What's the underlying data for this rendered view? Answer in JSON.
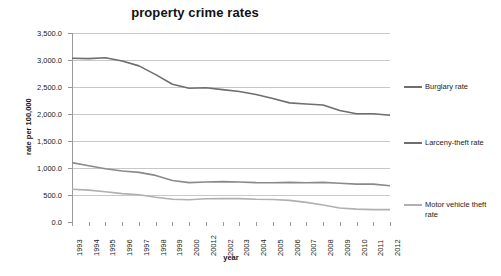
{
  "chart_data": {
    "type": "line",
    "title": "property crime rates",
    "xlabel": "year",
    "ylabel": "rate per 100,000",
    "ylim": [
      0,
      3500
    ],
    "ytick_step": 500,
    "grid": true,
    "legend_position": "right",
    "categories": [
      "1993",
      "1994",
      "1995",
      "1996",
      "1997",
      "1998",
      "1999",
      "2000",
      "20012",
      "2002",
      "2003",
      "2004",
      "2005",
      "2006",
      "2007",
      "2008",
      "2009",
      "2010",
      "2011",
      "2012"
    ],
    "ytick_labels": [
      "0.0",
      "500.0",
      "1,000.0",
      "1,500.0",
      "2,000.0",
      "2,500.0",
      "3,000.0",
      "3,500.0"
    ],
    "ytick_values": [
      0,
      500,
      1000,
      1500,
      2000,
      2500,
      3000,
      3500
    ],
    "series": [
      {
        "name": "Larceny-theft rate",
        "color": "#6e6e6e",
        "values": [
          3033,
          3026,
          3043,
          2980,
          2891,
          2729,
          2551,
          2477,
          2485,
          2451,
          2416,
          2362,
          2287,
          2206,
          2185,
          2167,
          2064,
          2005,
          2005,
          1977
        ]
      },
      {
        "name": "Burglary rate",
        "color": "#8a8a8a",
        "values": [
          1100,
          1042,
          987,
          945,
          919,
          863,
          770,
          729,
          741,
          747,
          741,
          730,
          727,
          733,
          726,
          733,
          717,
          701,
          702,
          670
        ]
      },
      {
        "name": "Motor vehicle theft rate",
        "color": "#b0b0b0",
        "values": [
          606,
          591,
          560,
          526,
          506,
          459,
          422,
          412,
          431,
          432,
          433,
          421,
          417,
          400,
          364,
          315,
          259,
          239,
          230,
          229
        ]
      }
    ],
    "legend_order": [
      "Burglary rate",
      "Larceny-theft rate",
      "Motor vehicle theft rate"
    ],
    "legend_entries": [
      {
        "label": "Burglary rate",
        "color": "#6e6e6e"
      },
      {
        "label": "Larceny-theft rate",
        "color": "#6e6e6e"
      },
      {
        "label": "Motor vehicle theft rate",
        "color": "#b0b0b0"
      }
    ]
  },
  "colors": {
    "grid": "#c8c8c8",
    "axis": "#9a9a9a",
    "text": "#1a1a1a",
    "background": "#ffffff"
  }
}
